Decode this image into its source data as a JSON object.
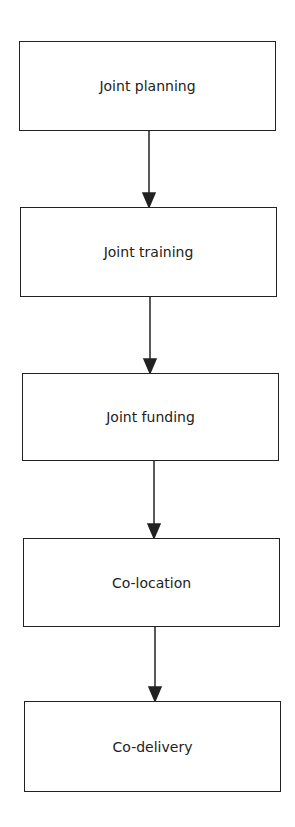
{
  "diagram": {
    "type": "flowchart",
    "direction": "top-to-bottom",
    "nodes": [
      {
        "id": "n1",
        "label": "Joint planning",
        "box": [
          19,
          41,
          257,
          90
        ]
      },
      {
        "id": "n2",
        "label": "Joint training",
        "box": [
          20,
          207,
          257,
          90
        ]
      },
      {
        "id": "n3",
        "label": "Joint funding",
        "box": [
          22,
          373,
          257,
          88
        ]
      },
      {
        "id": "n4",
        "label": "Co-location",
        "box": [
          23,
          538,
          257,
          89
        ]
      },
      {
        "id": "n5",
        "label": "Co-delivery",
        "box": [
          24,
          701,
          257,
          91
        ]
      }
    ],
    "edges": [
      {
        "from": "n1",
        "to": "n2",
        "x": 149,
        "y1": 131,
        "y2": 207
      },
      {
        "from": "n2",
        "to": "n3",
        "x": 150,
        "y1": 297,
        "y2": 373
      },
      {
        "from": "n3",
        "to": "n4",
        "x": 154,
        "y1": 461,
        "y2": 538
      },
      {
        "from": "n4",
        "to": "n5",
        "x": 155,
        "y1": 627,
        "y2": 701
      }
    ]
  }
}
